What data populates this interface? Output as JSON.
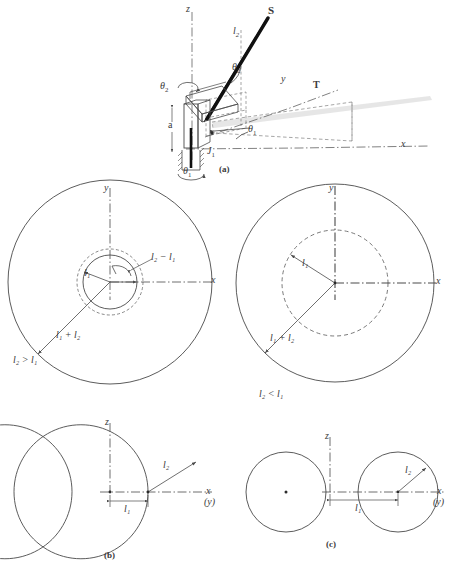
{
  "figure": {
    "panels": [
      {
        "id": "a",
        "caption": "(a)",
        "description": "isometric view of two-link manipulator"
      },
      {
        "id": "b",
        "caption": "(b)",
        "description": "side section workspace when l2 > l1"
      },
      {
        "id": "c",
        "caption": "(c)",
        "description": "side section workspace when l2 < l1"
      }
    ]
  },
  "panel_a": {
    "caption": "(a)",
    "axis_z": "z",
    "axis_x": "x",
    "axis_y": "y",
    "point_S": "S",
    "point_T": "T",
    "joint_1": "J",
    "joint_1_sub": "1",
    "link_2": "l",
    "link_2_sub": "2",
    "offset_a": "a",
    "theta_1_upper": "θ",
    "theta_1_sub": "1",
    "theta_2_upper": "θ",
    "theta_2_sub": "2",
    "theta_2_left": "θ",
    "theta_2_left_sub": "2",
    "theta_1_base": "θ",
    "theta_1_base_sub": "1"
  },
  "panel_top_left": {
    "condition": "l₂ > l₁",
    "condition_base": "l",
    "condition_sub": "2",
    "condition_rel": ">",
    "condition_base2": "l",
    "condition_sub2": "1",
    "axis_y": "y",
    "axis_x": "x",
    "radius_outer_label": "l₁ + l₂",
    "radius_inner_label": "l₁",
    "annulus_label": "l₂ − l₁",
    "outer_radius_px": 102,
    "dashed_radius_px": 33,
    "inner_radius_px": 27
  },
  "panel_top_right": {
    "condition": "l₂ < l₁",
    "axis_y": "y",
    "axis_x": "x",
    "radius_outer_label": "l₁ + l₂",
    "radius_inner_label": "l₁",
    "outer_radius_px": 99,
    "dashed_radius_px": 53
  },
  "panel_b": {
    "caption": "(b)",
    "axis_z": "z",
    "axis_x": "x",
    "axis_y_paren": "(y)",
    "dim_l1": "l₁",
    "dim_l2": "l₂",
    "lobe_radius_px": 67,
    "offset_px": 38
  },
  "panel_c": {
    "caption": "(c)",
    "axis_z": "z",
    "axis_x": "x",
    "axis_y_paren": "(y)",
    "dim_l1": "l₁",
    "dim_l2": "l₂",
    "circle_radius_px": 40,
    "offset_px": 68
  },
  "colors": {
    "line": "#4a4a4a",
    "line_dark": "#2b2b2b",
    "bold_link": "#111111",
    "text": "#3a3a3a",
    "background": "#ffffff",
    "shadow": "#cfcfcf"
  }
}
